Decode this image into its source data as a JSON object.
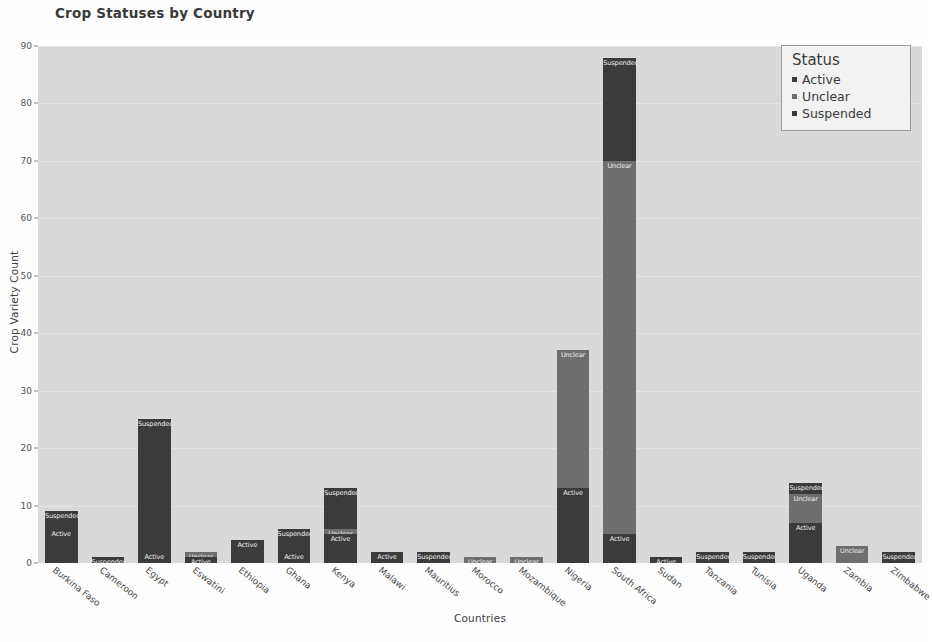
{
  "chart_data": {
    "type": "bar",
    "title": "Crop Statuses by Country",
    "xlabel": "Countries",
    "ylabel": "Crop Variety Count",
    "ylim": [
      0,
      90
    ],
    "yticks": [
      0,
      10,
      20,
      30,
      40,
      50,
      60,
      70,
      80,
      90
    ],
    "grid": true,
    "stacked": true,
    "legend": {
      "title": "Status",
      "position": "top-right",
      "entries": [
        "Active",
        "Unclear",
        "Suspended"
      ]
    },
    "categories": [
      "Burkina Faso",
      "Cameroon",
      "Egypt",
      "Eswatini",
      "Ethiopia",
      "Ghana",
      "Kenya",
      "Malawi",
      "Mauritius",
      "Morocco",
      "Mozambique",
      "Nigeria",
      "South Africa",
      "Sudan",
      "Tanzania",
      "Tunisia",
      "Uganda",
      "Zambia",
      "Zimbabwe"
    ],
    "series": [
      {
        "name": "Active",
        "color": "#3b3b3b",
        "values": [
          6,
          0,
          2,
          1,
          4,
          2,
          5,
          2,
          0,
          0,
          0,
          13,
          5,
          1,
          0,
          0,
          7,
          0,
          0
        ]
      },
      {
        "name": "Unclear",
        "color": "#6e6e6e",
        "values": [
          0,
          0,
          0,
          1,
          0,
          0,
          1,
          0,
          0,
          1,
          1,
          24,
          65,
          0,
          0,
          0,
          5,
          3,
          0
        ]
      },
      {
        "name": "Suspended",
        "color": "#3b3b3b",
        "values": [
          3,
          1,
          23,
          0,
          0,
          4,
          7,
          0,
          2,
          0,
          0,
          0,
          18,
          0,
          2,
          2,
          2,
          0,
          2
        ]
      }
    ],
    "totals": [
      9,
      1,
      25,
      2,
      4,
      6,
      13,
      2,
      2,
      1,
      1,
      37,
      88,
      1,
      2,
      2,
      14,
      3,
      2
    ]
  },
  "colors": {
    "plot_background": "#d9d9d9",
    "figure_background": "#fdfdfd",
    "active": "#3b3b3b",
    "unclear": "#6e6e6e",
    "suspended": "#3b3b3b",
    "text": "#3a3a3a"
  }
}
